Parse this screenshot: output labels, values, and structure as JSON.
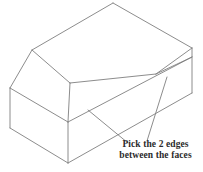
{
  "figure": {
    "stroke_color": "#7f7f7f",
    "background_color": "#ffffff",
    "stroke_width": 0.9,
    "solid_name": "chamfered-rectangular-box",
    "edges": [
      {
        "name": "top-back-left-ridge",
        "x1": 113,
        "y1": 3,
        "x2": 32,
        "y2": 50
      },
      {
        "name": "top-back-right-edge",
        "x1": 113,
        "y1": 3,
        "x2": 192,
        "y2": 48
      },
      {
        "name": "top-face-front-ridge",
        "x1": 32,
        "y1": 50,
        "x2": 70,
        "y2": 83
      },
      {
        "name": "top-right-front-ridge",
        "x1": 192,
        "y1": 48,
        "x2": 156,
        "y2": 74
      },
      {
        "name": "top-ridge-front-long",
        "x1": 70,
        "y1": 83,
        "x2": 156,
        "y2": 74
      },
      {
        "name": "chamfer-left-edge",
        "x1": 32,
        "y1": 50,
        "x2": 10,
        "y2": 88
      },
      {
        "name": "chamfer-bottom-ridge",
        "x1": 10,
        "y1": 88,
        "x2": 68,
        "y2": 122
      },
      {
        "name": "chamfer-front-edge",
        "x1": 70,
        "y1": 83,
        "x2": 68,
        "y2": 122
      },
      {
        "name": "left-face-vertical",
        "x1": 10,
        "y1": 88,
        "x2": 10,
        "y2": 128
      },
      {
        "name": "left-face-bottom",
        "x1": 10,
        "y1": 128,
        "x2": 68,
        "y2": 163
      },
      {
        "name": "front-face-vertical",
        "x1": 68,
        "y1": 122,
        "x2": 68,
        "y2": 163
      },
      {
        "name": "front-face-bottom",
        "x1": 68,
        "y1": 163,
        "x2": 192,
        "y2": 93
      },
      {
        "name": "right-face-vertical",
        "x1": 192,
        "y1": 48,
        "x2": 192,
        "y2": 93
      },
      {
        "name": "front-top-long-edge",
        "x1": 68,
        "y1": 122,
        "x2": 192,
        "y2": 57
      },
      {
        "name": "chamfer-right-short-edge",
        "x1": 156,
        "y1": 74,
        "x2": 192,
        "y2": 57
      }
    ],
    "leader_lines": [
      {
        "name": "leader-line-lower-chamfer",
        "x1": 88,
        "y1": 110,
        "x2": 128,
        "y2": 143
      },
      {
        "name": "leader-line-upper-chamfer",
        "x1": 167,
        "y1": 77,
        "x2": 147,
        "y2": 141
      }
    ]
  },
  "caption": {
    "line1": "Pick the 2 edges",
    "line2": "between the faces",
    "color": "#2b2b2b"
  }
}
